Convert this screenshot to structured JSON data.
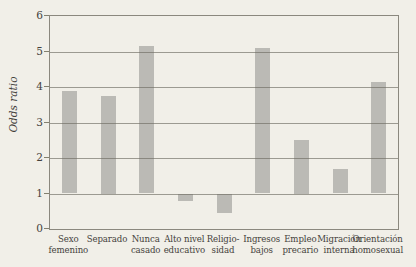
{
  "figure": {
    "background_color": "#f1efe8",
    "kind": "scanned book figure, no caption visible"
  },
  "chart_data": {
    "type": "bar",
    "title": "",
    "xlabel": "",
    "ylabel": "Odds ratio",
    "categories": [
      "Sexo\nfemenino",
      "Separado",
      "Nunca\ncasado",
      "Alto nivel\neducativo",
      "Religio-\nsidad",
      "Ingresos\nbajos",
      "Empleo\nprecario",
      "Migración\ninterna",
      "Orientación\nhomosexual"
    ],
    "values": [
      3.9,
      3.75,
      5.15,
      0.8,
      0.45,
      5.1,
      2.5,
      1.7,
      4.15
    ],
    "baseline": 1,
    "ylim": [
      0,
      6
    ],
    "yticks": [
      0,
      1,
      2,
      3,
      4,
      5,
      6
    ],
    "grid": "horizontal gridlines at integer values, drawn over bars",
    "legend": "none",
    "bar_color": "#bbbab5",
    "gridline_color": "#6e6b62",
    "frame_color": "#8b887e",
    "text_color": "#45423c"
  }
}
